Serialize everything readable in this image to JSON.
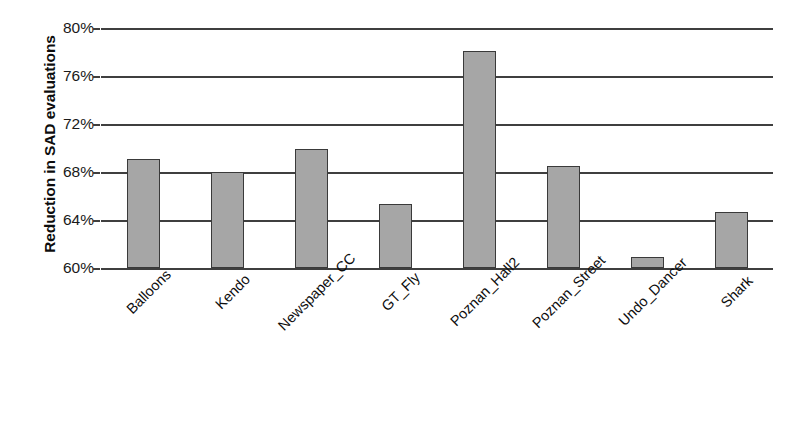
{
  "chart_data": {
    "type": "bar",
    "title": "",
    "xlabel": "",
    "ylabel": "Reduction in SAD evaluations",
    "categories": [
      "Balloons",
      "Kendo",
      "Newspaper_CC",
      "GT_Fly",
      "Poznan_Hall2",
      "Poznan_Street",
      "Undo_Dancer",
      "Shark"
    ],
    "values": [
      69.1,
      68.0,
      69.9,
      65.3,
      78.1,
      68.5,
      60.9,
      64.7
    ],
    "value_labels": [
      "69.1%",
      "68.0%",
      "69.9%",
      "65.3%",
      "78.1%",
      "68.5%",
      "60.9%",
      "64.7%"
    ],
    "ylim": [
      60,
      80
    ],
    "ytick_values": [
      80,
      76,
      72,
      68,
      64,
      60
    ],
    "ytick_labels": [
      "80%",
      "76%",
      "72%",
      "68%",
      "64%",
      "60%"
    ],
    "grid": true,
    "legend": null,
    "legend_position": "none",
    "bar_fill_color": "#a6a6a6",
    "bar_border_color": "#3a3a3a",
    "axis_color": "#3f3f3f",
    "background_color": "#ffffff"
  }
}
